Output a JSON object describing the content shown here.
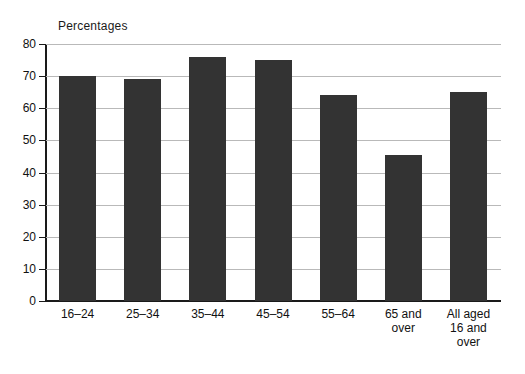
{
  "chart_data": {
    "type": "bar",
    "title": "Percentages",
    "xlabel": "",
    "ylabel": "",
    "ylim": [
      0,
      80
    ],
    "yticks": [
      0,
      10,
      20,
      30,
      40,
      50,
      60,
      70,
      80
    ],
    "grid": true,
    "legend": false,
    "bar_color": "#333333",
    "gridline_color": "#b9b9b9",
    "axis_color": "#1a1a1a",
    "background": "#ffffff",
    "categories": [
      "16–24",
      "25–34",
      "35–44",
      "45–54",
      "55–64",
      "65 and\nover",
      "All aged\n16 and\nover"
    ],
    "values": [
      70,
      69,
      76,
      75,
      64,
      45.5,
      65
    ]
  },
  "axis": {
    "y_tick_labels": [
      "80",
      "70",
      "60",
      "50",
      "40",
      "30",
      "20",
      "10",
      "0"
    ]
  }
}
